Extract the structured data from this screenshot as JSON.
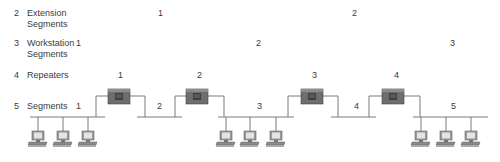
{
  "rows": [
    {
      "count": "2",
      "label1": "Extension",
      "label2": "Segments"
    },
    {
      "count": "3",
      "label1": "Workstation",
      "label2": "Segments"
    },
    {
      "count": "4",
      "label1": "Repeaters",
      "label2": ""
    },
    {
      "count": "5",
      "label1": "Segments",
      "label2": ""
    }
  ],
  "extension_numbers": [
    "1",
    "2"
  ],
  "workstation_numbers": [
    "1",
    "2",
    "3"
  ],
  "repeater_numbers": [
    "1",
    "2",
    "3",
    "4"
  ],
  "segment_numbers": [
    "1",
    "2",
    "3",
    "4",
    "5"
  ]
}
